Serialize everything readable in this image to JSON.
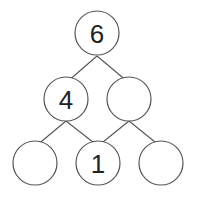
{
  "diagram": {
    "type": "number-pyramid-tree",
    "nodes": [
      {
        "id": "top",
        "value": "6",
        "cx": 97,
        "cy": 33,
        "r": 22
      },
      {
        "id": "mid-left",
        "value": "4",
        "cx": 66,
        "cy": 99,
        "r": 22
      },
      {
        "id": "mid-right",
        "value": "",
        "cx": 129,
        "cy": 99,
        "r": 22
      },
      {
        "id": "bottom-left",
        "value": "",
        "cx": 35,
        "cy": 163,
        "r": 22
      },
      {
        "id": "bottom-middle",
        "value": "1",
        "cx": 98,
        "cy": 163,
        "r": 22
      },
      {
        "id": "bottom-right",
        "value": "",
        "cx": 161,
        "cy": 163,
        "r": 22
      }
    ],
    "edges": [
      {
        "from": "top",
        "to": "mid-left"
      },
      {
        "from": "top",
        "to": "mid-right"
      },
      {
        "from": "mid-left",
        "to": "bottom-left"
      },
      {
        "from": "mid-left",
        "to": "bottom-middle"
      },
      {
        "from": "mid-right",
        "to": "bottom-middle"
      },
      {
        "from": "mid-right",
        "to": "bottom-right"
      }
    ]
  }
}
